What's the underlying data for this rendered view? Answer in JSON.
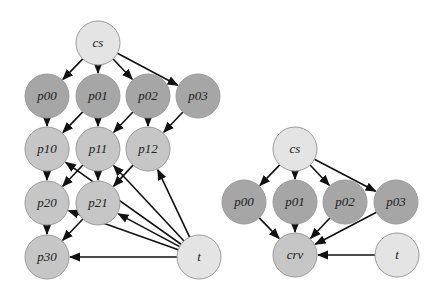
{
  "colors": {
    "light": "#e4e4e4",
    "dark": "#a6a6a6",
    "medium": "#c6c6c6",
    "stroke": "#9a9a9a",
    "edge": "#111111"
  },
  "graphs": [
    {
      "name": "left-graph",
      "nodes": [
        {
          "id": "cs",
          "label": "cs",
          "x": 98,
          "y": 43,
          "fill": "light"
        },
        {
          "id": "p00",
          "label": "p00",
          "x": 47,
          "y": 96,
          "fill": "dark"
        },
        {
          "id": "p01",
          "label": "p01",
          "x": 98,
          "y": 96,
          "fill": "dark"
        },
        {
          "id": "p02",
          "label": "p02",
          "x": 148,
          "y": 96,
          "fill": "dark"
        },
        {
          "id": "p03",
          "label": "p03",
          "x": 198,
          "y": 96,
          "fill": "dark"
        },
        {
          "id": "p10",
          "label": "p10",
          "x": 47,
          "y": 149,
          "fill": "medium"
        },
        {
          "id": "p11",
          "label": "p11",
          "x": 98,
          "y": 149,
          "fill": "medium"
        },
        {
          "id": "p12",
          "label": "p12",
          "x": 148,
          "y": 149,
          "fill": "medium"
        },
        {
          "id": "p20",
          "label": "p20",
          "x": 47,
          "y": 203,
          "fill": "medium"
        },
        {
          "id": "p21",
          "label": "p21",
          "x": 98,
          "y": 203,
          "fill": "medium"
        },
        {
          "id": "p30",
          "label": "p30",
          "x": 47,
          "y": 257,
          "fill": "medium"
        },
        {
          "id": "t",
          "label": "t",
          "x": 199,
          "y": 257,
          "fill": "light"
        }
      ],
      "edges": [
        [
          "cs",
          "p00"
        ],
        [
          "cs",
          "p01"
        ],
        [
          "cs",
          "p02"
        ],
        [
          "cs",
          "p03"
        ],
        [
          "p00",
          "p10"
        ],
        [
          "p01",
          "p10"
        ],
        [
          "p01",
          "p11"
        ],
        [
          "p02",
          "p11"
        ],
        [
          "p02",
          "p12"
        ],
        [
          "p03",
          "p12"
        ],
        [
          "p10",
          "p20"
        ],
        [
          "p11",
          "p20"
        ],
        [
          "p11",
          "p21"
        ],
        [
          "p12",
          "p21"
        ],
        [
          "p20",
          "p30"
        ],
        [
          "p21",
          "p30"
        ],
        [
          "t",
          "p30"
        ],
        [
          "t",
          "p20"
        ],
        [
          "t",
          "p21"
        ],
        [
          "t",
          "p10"
        ],
        [
          "t",
          "p11"
        ],
        [
          "t",
          "p12"
        ]
      ]
    },
    {
      "name": "right-graph",
      "nodes": [
        {
          "id": "cs",
          "label": "cs",
          "x": 295,
          "y": 149,
          "fill": "light"
        },
        {
          "id": "p00",
          "label": "p00",
          "x": 244,
          "y": 202,
          "fill": "dark"
        },
        {
          "id": "p01",
          "label": "p01",
          "x": 295,
          "y": 202,
          "fill": "dark"
        },
        {
          "id": "p02",
          "label": "p02",
          "x": 345,
          "y": 202,
          "fill": "dark"
        },
        {
          "id": "p03",
          "label": "p03",
          "x": 396,
          "y": 202,
          "fill": "dark"
        },
        {
          "id": "crv",
          "label": "crv",
          "x": 295,
          "y": 255,
          "fill": "medium"
        },
        {
          "id": "t",
          "label": "t",
          "x": 397,
          "y": 255,
          "fill": "light"
        }
      ],
      "edges": [
        [
          "cs",
          "p00"
        ],
        [
          "cs",
          "p01"
        ],
        [
          "cs",
          "p02"
        ],
        [
          "cs",
          "p03"
        ],
        [
          "p00",
          "crv"
        ],
        [
          "p01",
          "crv"
        ],
        [
          "p02",
          "crv"
        ],
        [
          "p03",
          "crv"
        ],
        [
          "t",
          "crv"
        ]
      ]
    }
  ],
  "node_radius": 22
}
